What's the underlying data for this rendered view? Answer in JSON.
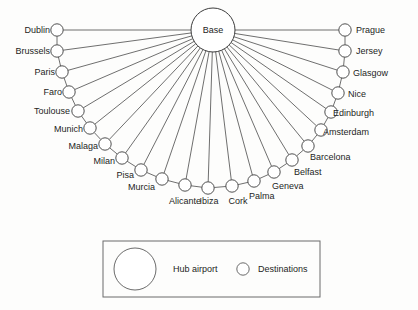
{
  "diagram": {
    "hub": {
      "label": "Base",
      "cx": 213,
      "cy": 30,
      "r": 22
    },
    "node_radius": 6.2,
    "line_color": "#4a4a4a",
    "node_fill": "#ffffff",
    "destinations": [
      {
        "label": "Dublin",
        "cx": 57,
        "cy": 30,
        "label_x": 7,
        "label_y": 25,
        "label_align": "right",
        "label_w": 43
      },
      {
        "label": "Brussels",
        "cx": 57,
        "cy": 51,
        "label_x": 0,
        "label_y": 46,
        "label_align": "right",
        "label_w": 50
      },
      {
        "label": "Paris",
        "cx": 62,
        "cy": 72,
        "label_x": 12,
        "label_y": 67,
        "label_align": "right",
        "label_w": 43
      },
      {
        "label": "Faro",
        "cx": 69,
        "cy": 92,
        "label_x": 19,
        "label_y": 87,
        "label_align": "right",
        "label_w": 43
      },
      {
        "label": "Toulouse",
        "cx": 78,
        "cy": 111,
        "label_x": 10,
        "label_y": 106,
        "label_align": "right",
        "label_w": 60
      },
      {
        "label": "Munich",
        "cx": 90,
        "cy": 128,
        "label_x": 25,
        "label_y": 124,
        "label_align": "right",
        "label_w": 58
      },
      {
        "label": "Malaga",
        "cx": 105,
        "cy": 144,
        "label_x": 40,
        "label_y": 141,
        "label_align": "right",
        "label_w": 58
      },
      {
        "label": "Milan",
        "cx": 122,
        "cy": 158,
        "label_x": 61,
        "label_y": 156,
        "label_align": "right",
        "label_w": 54
      },
      {
        "label": "Pisa",
        "cx": 141,
        "cy": 170,
        "label_x": 86,
        "label_y": 170,
        "label_align": "right",
        "label_w": 48
      },
      {
        "label": "Murcia",
        "cx": 162,
        "cy": 179,
        "label_x": 99,
        "label_y": 182,
        "label_align": "right",
        "label_w": 56
      },
      {
        "label": "Alicante",
        "cx": 185,
        "cy": 185,
        "label_x": 156,
        "label_y": 196,
        "label_align": "center",
        "label_w": 58
      },
      {
        "label": "Ibiza",
        "cx": 208,
        "cy": 188,
        "label_x": 188,
        "label_y": 196,
        "label_align": "center",
        "label_w": 42
      },
      {
        "label": "Cork",
        "cx": 232,
        "cy": 186,
        "label_x": 216,
        "label_y": 196,
        "label_align": "center",
        "label_w": 44
      },
      {
        "label": "Palma",
        "cx": 254,
        "cy": 181,
        "label_x": 249,
        "label_y": 191,
        "label_align": "left",
        "label_w": 56
      },
      {
        "label": "Geneva",
        "cx": 274,
        "cy": 172,
        "label_x": 272,
        "label_y": 181,
        "label_align": "left",
        "label_w": 56
      },
      {
        "label": "Belfast",
        "cx": 292,
        "cy": 160,
        "label_x": 294,
        "label_y": 167,
        "label_align": "left",
        "label_w": 56
      },
      {
        "label": "Barcelona",
        "cx": 308,
        "cy": 146,
        "label_x": 310,
        "label_y": 152,
        "label_align": "left",
        "label_w": 64
      },
      {
        "label": "Amsterdam",
        "cx": 321,
        "cy": 130,
        "label_x": 323,
        "label_y": 127,
        "label_align": "left",
        "label_w": 70
      },
      {
        "label": "Edinburgh",
        "cx": 331,
        "cy": 112,
        "label_x": 333,
        "label_y": 108,
        "label_align": "left",
        "label_w": 68
      },
      {
        "label": "Nice",
        "cx": 338,
        "cy": 93,
        "label_x": 348,
        "label_y": 89,
        "label_align": "left",
        "label_w": 44
      },
      {
        "label": "Glasgow",
        "cx": 343,
        "cy": 72,
        "label_x": 353,
        "label_y": 68,
        "label_align": "left",
        "label_w": 58
      },
      {
        "label": "Jersey",
        "cx": 345,
        "cy": 51,
        "label_x": 356,
        "label_y": 46,
        "label_align": "left",
        "label_w": 52
      },
      {
        "label": "Prague",
        "cx": 345,
        "cy": 30,
        "label_x": 356,
        "label_y": 25,
        "label_align": "left",
        "label_w": 56
      }
    ]
  },
  "legend": {
    "box": {
      "x": 103,
      "y": 241,
      "width": 217,
      "height": 56
    },
    "hub_symbol": {
      "cx": 135,
      "cy": 269,
      "r": 21
    },
    "hub_label": "Hub airport",
    "hub_label_x": 173,
    "hub_label_y": 264,
    "dest_symbol": {
      "cx": 243,
      "cy": 269,
      "r": 6.2
    },
    "dest_label": "Destinations",
    "dest_label_x": 258,
    "dest_label_y": 264
  }
}
